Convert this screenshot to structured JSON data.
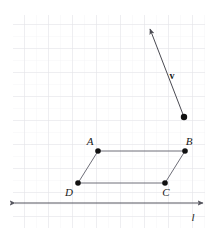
{
  "figure": {
    "background_color": "#ffffff",
    "width": 213,
    "height": 231
  },
  "grid": {
    "name": "graph-paper-grid",
    "cell_size": 24,
    "minor_cell_size": 12,
    "color_major": "#e2e2e6",
    "color_minor": "#f0f0f3",
    "left": 13,
    "top": 15,
    "right": 205,
    "bottom": 228,
    "visible": true
  },
  "vector": {
    "name": "vector-v",
    "label": "v",
    "label_x": 172,
    "label_y": 79,
    "tail_x": 184,
    "tail_y": 117,
    "head_x": 150,
    "head_y": 29,
    "color": "#4a4a52",
    "stroke_width": 1,
    "has_arrowhead": true,
    "tail_dot_radius": 3.2
  },
  "parallelogram": {
    "name": "parallelogram-ABCD",
    "stroke_color": "#6e6e78",
    "stroke_width": 1,
    "fill": "none",
    "vertices": [
      {
        "label": "A",
        "x": 98,
        "y": 151,
        "label_x": 90,
        "label_y": 145
      },
      {
        "label": "B",
        "x": 185,
        "y": 151,
        "label_x": 189,
        "label_y": 145
      },
      {
        "label": "C",
        "x": 165,
        "y": 183,
        "label_x": 166,
        "label_y": 196
      },
      {
        "label": "D",
        "x": 78,
        "y": 183,
        "label_x": 69,
        "label_y": 196
      }
    ],
    "dot_radius": 2.8,
    "dot_color": "#111111"
  },
  "line_l": {
    "name": "line-l",
    "label": "l",
    "label_x": 193,
    "label_y": 221,
    "y": 203,
    "x_start": 15,
    "x_end": 203,
    "color": "#55555e",
    "stroke_width": 1,
    "arrow_both_ends": true
  },
  "colors": {
    "ink": "#1a1a1a",
    "geometry_stroke": "#6e6e78",
    "axis_stroke": "#55555e",
    "grid_major": "#e2e2e6",
    "grid_minor": "#f0f0f3",
    "point_fill": "#111111"
  }
}
